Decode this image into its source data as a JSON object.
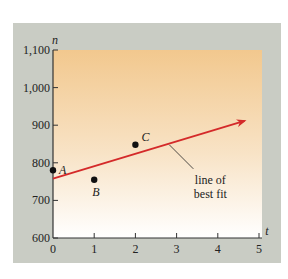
{
  "chart_data": {
    "type": "scatter",
    "title": "",
    "xlabel": "t",
    "ylabel": "n",
    "xlim": [
      0,
      5
    ],
    "ylim": [
      600,
      1100
    ],
    "x_ticks": [
      "0",
      "1",
      "2",
      "3",
      "4",
      "5"
    ],
    "y_ticks": [
      "600",
      "700",
      "800",
      "900",
      "1,000",
      "1,100"
    ],
    "grid": false,
    "points": [
      {
        "label": "A",
        "t": 0,
        "n": 780
      },
      {
        "label": "B",
        "t": 1,
        "n": 755
      },
      {
        "label": "C",
        "t": 2,
        "n": 848
      }
    ],
    "series": [
      {
        "name": "line of best fit",
        "type": "line",
        "intercept": 758,
        "slope": 33,
        "t_range": [
          0,
          4.65
        ],
        "color": "#d42a2a",
        "arrow": true
      }
    ],
    "annotations": [
      {
        "text": "line of best fit",
        "lines": [
          "line of",
          "best fit"
        ],
        "points_to_t": 2.8
      }
    ],
    "colors": {
      "panel_bg": "#c9ccc4",
      "plot_gradient_top": "#f2c88e",
      "plot_gradient_bottom": "#ffffff",
      "line": "#d42a2a",
      "points": "#111111"
    }
  }
}
